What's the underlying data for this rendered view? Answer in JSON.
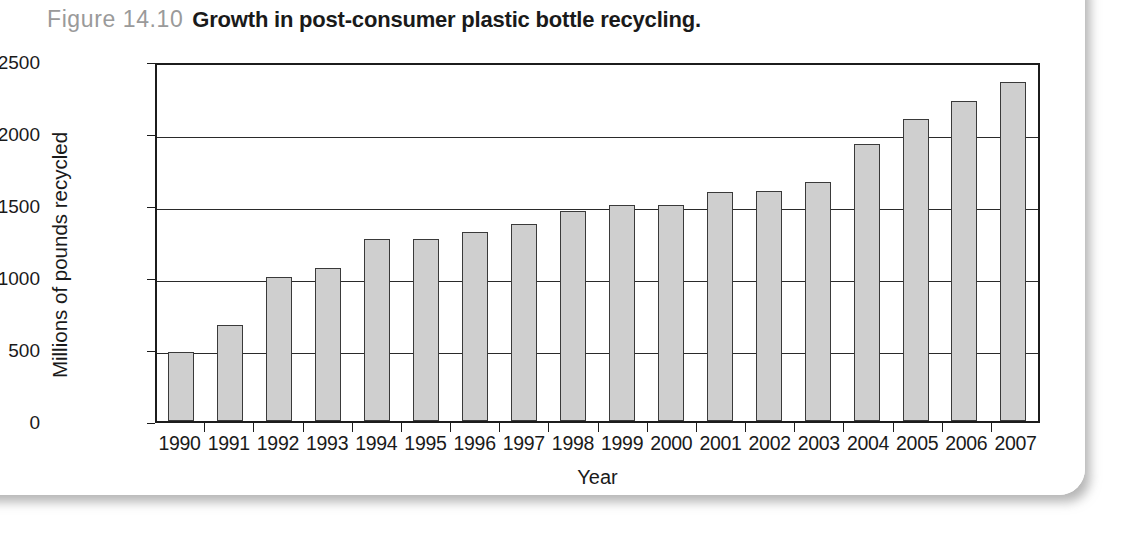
{
  "figure": {
    "number_label": "Figure 14.10",
    "caption": "Growth in post-consumer plastic bottle recycling."
  },
  "chart_data": {
    "type": "bar",
    "title": "Growth in post-consumer plastic bottle recycling.",
    "xlabel": "Year",
    "ylabel": "Millions of pounds recycled",
    "ylim": [
      0,
      2500
    ],
    "yticks": [
      0,
      500,
      1000,
      1500,
      2000,
      2500
    ],
    "ytick_labels": [
      "0",
      "500",
      "1000",
      "1500",
      "2000",
      "2500"
    ],
    "grid": "horizontal",
    "legend": "none",
    "bar_color": "#cfcfcf",
    "bar_edge_color": "#3a3a3a",
    "categories": [
      "1990",
      "1991",
      "1992",
      "1993",
      "1994",
      "1995",
      "1996",
      "1997",
      "1998",
      "1999",
      "2000",
      "2001",
      "2002",
      "2003",
      "2004",
      "2005",
      "2006",
      "2007"
    ],
    "values": [
      480,
      670,
      1000,
      1065,
      1265,
      1265,
      1315,
      1370,
      1455,
      1500,
      1500,
      1590,
      1600,
      1660,
      1925,
      2100,
      2225,
      2355
    ]
  }
}
